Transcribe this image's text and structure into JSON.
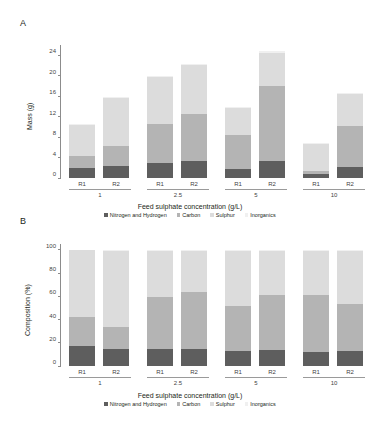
{
  "figure": {
    "panels": [
      {
        "letter": "A",
        "name": "mass-panel"
      },
      {
        "letter": "B",
        "name": "composition-panel"
      }
    ]
  },
  "legend": {
    "items": [
      {
        "label": "Nitrogen and Hydrogen",
        "color": "#5e5e5e"
      },
      {
        "label": "Carbon",
        "color": "#b4b4b4"
      },
      {
        "label": "Sulphur",
        "color": "#dcdcdc"
      },
      {
        "label": "Inorganics",
        "color": "#f0f0f0"
      }
    ]
  },
  "chart_data": [
    {
      "type": "bar",
      "stacked": true,
      "panel": "A",
      "title": "",
      "xlabel": "Feed sulphate concentration (g/L)",
      "ylabel": "Mass (g)",
      "ylim": [
        0,
        26
      ],
      "yticks": [
        0,
        4,
        8,
        12,
        16,
        20,
        24
      ],
      "grid": false,
      "legend_position": "bottom",
      "groups": [
        "1",
        "2.5",
        "5",
        "10"
      ],
      "replicates": [
        "R1",
        "R2"
      ],
      "categories": [
        "1 R1",
        "1 R2",
        "2.5 R1",
        "2.5 R2",
        "5 R1",
        "5 R2",
        "10 R1",
        "10 R2"
      ],
      "series": [
        {
          "name": "Nitrogen and Hydrogen",
          "color": "#5e5e5e",
          "values": [
            1.9,
            2.4,
            2.9,
            3.4,
            1.7,
            3.3,
            0.8,
            2.2
          ]
        },
        {
          "name": "Carbon",
          "color": "#b4b4b4",
          "values": [
            2.5,
            3.8,
            7.7,
            9.1,
            6.7,
            14.6,
            0.6,
            7.9
          ]
        },
        {
          "name": "Sulphur",
          "color": "#dcdcdc",
          "values": [
            5.9,
            9.5,
            9.2,
            9.6,
            5.2,
            6.6,
            5.2,
            6.3
          ]
        },
        {
          "name": "Inorganics",
          "color": "#f0f0f0",
          "values": [
            0.3,
            0.2,
            0.2,
            0.2,
            0.2,
            0.3,
            0.2,
            0.2
          ]
        }
      ],
      "totals": [
        10.6,
        15.9,
        20.0,
        22.3,
        13.8,
        24.8,
        6.8,
        16.6
      ]
    },
    {
      "type": "bar",
      "stacked": true,
      "panel": "B",
      "title": "",
      "xlabel": "Feed sulphate concentration (g/L)",
      "ylabel": "Composition (%)",
      "ylim": [
        0,
        105
      ],
      "yticks": [
        0,
        20,
        40,
        60,
        80,
        100
      ],
      "grid": false,
      "legend_position": "bottom",
      "groups": [
        "1",
        "2.5",
        "5",
        "10"
      ],
      "replicates": [
        "R1",
        "R2"
      ],
      "categories": [
        "1 R1",
        "1 R2",
        "2.5 R1",
        "2.5 R2",
        "5 R1",
        "5 R2",
        "10 R1",
        "10 R2"
      ],
      "series": [
        {
          "name": "Nitrogen and Hydrogen",
          "color": "#5e5e5e",
          "values": [
            17.5,
            15.0,
            14.5,
            15.0,
            12.5,
            13.5,
            12.0,
            13.0
          ]
        },
        {
          "name": "Carbon",
          "color": "#b4b4b4",
          "values": [
            25.0,
            18.5,
            44.5,
            48.5,
            39.0,
            47.5,
            49.5,
            40.0
          ]
        },
        {
          "name": "Sulphur",
          "color": "#dcdcdc",
          "values": [
            57.0,
            65.5,
            40.0,
            35.5,
            47.5,
            38.0,
            37.5,
            46.0
          ]
        },
        {
          "name": "Inorganics",
          "color": "#f0f0f0",
          "values": [
            0.5,
            1.0,
            1.0,
            1.0,
            1.0,
            1.0,
            1.0,
            1.0
          ]
        }
      ],
      "totals": [
        100,
        100,
        100,
        100,
        100,
        100,
        100,
        100
      ]
    }
  ]
}
